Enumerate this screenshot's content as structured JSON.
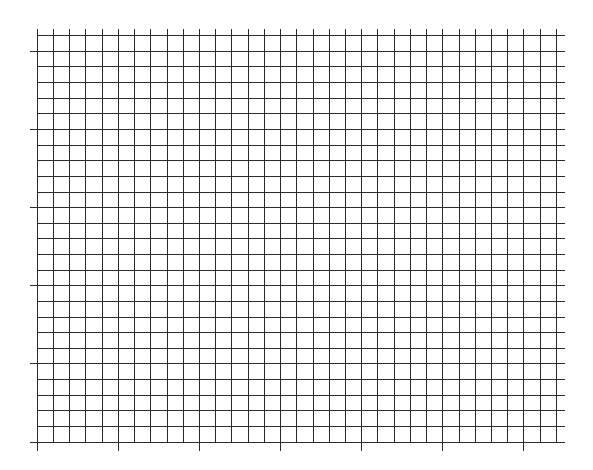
{
  "chart_data": {
    "type": "line",
    "title": "",
    "xlabel": "",
    "ylabel": "",
    "x_tick_labels": [],
    "y_tick_labels": [],
    "series": [],
    "grid": true,
    "legend": null,
    "layout": {
      "line_color": "#2b2b2b",
      "x_origin": 36.8,
      "x_step": 16.22,
      "x_lines": 33,
      "x_major_every": 5,
      "x_major_offset": 0,
      "y_origin": 35.2,
      "y_step": 15.63,
      "y_lines": 27,
      "y_major_every": 5,
      "y_major_offset": 1,
      "h_line_end": 565,
      "v_line_top": 28.5,
      "major_tick_length": 8
    }
  }
}
